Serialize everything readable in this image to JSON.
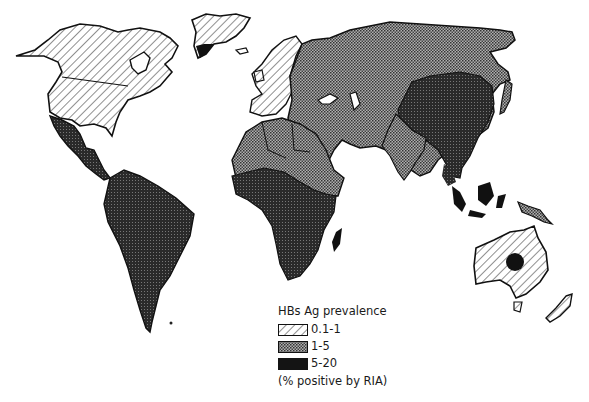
{
  "map": {
    "title": "HBs Ag prevalence",
    "subject": "World distribution of hepatitis B surface antigen prevalence",
    "legend": {
      "title": "HBs Ag prevalence",
      "items": [
        {
          "label": "0.1-1",
          "pattern": "diagonal-hatch",
          "color": "#ffffff"
        },
        {
          "label": "1-5",
          "pattern": "dot-stipple",
          "color": "#8a8a8a"
        },
        {
          "label": "5-20",
          "pattern": "solid",
          "color": "#141414"
        }
      ],
      "note": "(% positive by RIA)"
    },
    "regions": [
      {
        "name": "North America",
        "category": "0.1-1"
      },
      {
        "name": "Greenland",
        "category": "0.1-1"
      },
      {
        "name": "Western Europe",
        "category": "0.1-1"
      },
      {
        "name": "Australia",
        "category": "0.1-1"
      },
      {
        "name": "New Zealand",
        "category": "0.1-1"
      },
      {
        "name": "Mexico & Central America",
        "category": "5-20"
      },
      {
        "name": "South America",
        "category": "5-20"
      },
      {
        "name": "Eastern Europe & Russia",
        "category": "1-5"
      },
      {
        "name": "North Africa",
        "category": "1-5"
      },
      {
        "name": "Middle East",
        "category": "1-5"
      },
      {
        "name": "India",
        "category": "1-5"
      },
      {
        "name": "Japan",
        "category": "1-5"
      },
      {
        "name": "New Guinea",
        "category": "1-5"
      },
      {
        "name": "Sub-Saharan Africa",
        "category": "5-20"
      },
      {
        "name": "China",
        "category": "5-20"
      },
      {
        "name": "Southeast Asia",
        "category": "5-20"
      },
      {
        "name": "Indonesia",
        "category": "5-20"
      },
      {
        "name": "Central Australia (Aboriginal)",
        "category": "5-20"
      }
    ]
  }
}
